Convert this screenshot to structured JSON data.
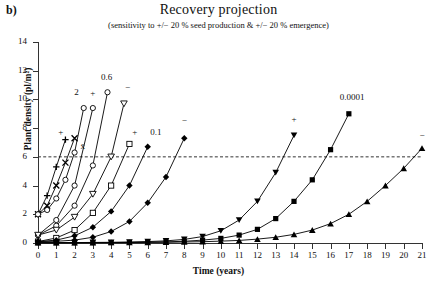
{
  "panel": {
    "label": "b)"
  },
  "title": "Recovery projection",
  "subtitle": "(sensitivity to +/− 20 % seed production & +/− 20 % emergence)",
  "axes": {
    "xlabel": "Time (years)",
    "ylabel": "Plant density (pl/m²)",
    "xticks": [
      "0",
      "1",
      "2",
      "3",
      "4",
      "5",
      "6",
      "7",
      "8",
      "9",
      "10",
      "11",
      "12",
      "13",
      "14",
      "15",
      "16",
      "17",
      "18",
      "19",
      "20",
      "21"
    ],
    "yticks": [
      "0",
      "2",
      "4",
      "6",
      "8",
      "10",
      "12",
      "14"
    ]
  },
  "annotations": {
    "group_2": "2",
    "group_06": "0.6",
    "group_01": "0.1",
    "group_00001": "0.0001",
    "plus": "+",
    "minus": "−",
    "mean": "x̄"
  },
  "chart_data": {
    "type": "line",
    "title": "Recovery projection",
    "subtitle": "(sensitivity to +/− 20 % seed production & +/− 20 % emergence)",
    "xlabel": "Time (years)",
    "ylabel": "Plant density (pl/m²)",
    "xlim": [
      0,
      21
    ],
    "ylim": [
      0,
      14
    ],
    "grid": false,
    "legend": "none",
    "threshold_line": {
      "y": 6,
      "style": "dashed",
      "color": "#333333"
    },
    "series": [
      {
        "name": "2 +",
        "group_label": "2",
        "sensitivity": "+",
        "marker": "plus-cross",
        "annotation": "+",
        "annotation_at": [
          1.25,
          7.6
        ],
        "x": [
          0,
          0.5,
          1,
          1.5
        ],
        "y": [
          2.0,
          3.3,
          5.3,
          7.2
        ]
      },
      {
        "name": "2 mean",
        "group_label": "2",
        "sensitivity": "mean",
        "marker": "x-cross",
        "annotation": "x̄",
        "annotation_at": [
          2.45,
          6.6
        ],
        "x": [
          0,
          0.5,
          1,
          1.5,
          2
        ],
        "y": [
          2.0,
          2.6,
          4.0,
          5.6,
          7.3
        ]
      },
      {
        "name": "2 −",
        "group_label": "2",
        "sensitivity": "−",
        "marker": "open-circle",
        "annotation": "2",
        "annotation_at": [
          2.1,
          10.4
        ],
        "x": [
          0,
          0.5,
          1,
          1.5,
          2,
          2.5
        ],
        "y": [
          2.0,
          2.3,
          3.1,
          4.4,
          6.3,
          9.4
        ]
      },
      {
        "name": "0.6 +",
        "group_label": "0.6",
        "sensitivity": "+",
        "marker": "open-circle",
        "annotation": "+",
        "annotation_at": [
          3.0,
          10.3
        ],
        "x": [
          0,
          1,
          2,
          3
        ],
        "y": [
          0.55,
          1.6,
          4.0,
          9.4
        ]
      },
      {
        "name": "0.6 mean",
        "group_label": "0.6",
        "sensitivity": "mean",
        "marker": "open-circle",
        "annotation": "0.6",
        "annotation_at": [
          3.75,
          11.4
        ],
        "x": [
          0,
          1,
          2,
          3,
          3.8
        ],
        "y": [
          0.55,
          1.2,
          2.6,
          5.4,
          10.5
        ]
      },
      {
        "name": "0.6 −",
        "group_label": "0.6",
        "sensitivity": "−",
        "marker": "open-triangle-down",
        "annotation": "−",
        "annotation_at": [
          4.9,
          10.7
        ],
        "x": [
          0,
          1,
          2,
          3,
          4,
          4.7
        ],
        "y": [
          0.55,
          0.9,
          1.8,
          3.4,
          6.0,
          9.7
        ]
      },
      {
        "name": "0.1 +",
        "group_label": "0.1",
        "sensitivity": "+",
        "marker": "open-square",
        "annotation": "+",
        "annotation_at": [
          5.3,
          7.6
        ],
        "x": [
          0,
          1,
          2,
          3,
          4,
          5
        ],
        "y": [
          0.1,
          0.35,
          0.9,
          2.1,
          4.0,
          6.9
        ]
      },
      {
        "name": "0.1 mean",
        "group_label": "0.1",
        "sensitivity": "mean",
        "marker": "filled-diamond",
        "annotation": "0.1",
        "annotation_at": [
          6.45,
          7.6
        ],
        "x": [
          0,
          1,
          2,
          3,
          4,
          5,
          6
        ],
        "y": [
          0.1,
          0.2,
          0.5,
          1.1,
          2.2,
          4.0,
          6.7
        ]
      },
      {
        "name": "0.1 −",
        "group_label": "0.1",
        "sensitivity": "−",
        "marker": "filled-diamond",
        "annotation": "−",
        "annotation_at": [
          8.0,
          8.4
        ],
        "x": [
          0,
          1,
          2,
          3,
          4,
          5,
          6,
          7,
          8
        ],
        "y": [
          0.1,
          0.12,
          0.2,
          0.4,
          0.8,
          1.5,
          2.8,
          4.6,
          7.3
        ]
      },
      {
        "name": "0.0001 +",
        "group_label": "0.0001",
        "sensitivity": "+",
        "marker": "filled-triangle-down",
        "annotation": "+",
        "annotation_at": [
          14.0,
          8.5
        ],
        "x": [
          0,
          1,
          2,
          3,
          4,
          5,
          6,
          7,
          8,
          9,
          10,
          11,
          12,
          13,
          14
        ],
        "y": [
          0.02,
          0.02,
          0.03,
          0.04,
          0.05,
          0.07,
          0.1,
          0.15,
          0.25,
          0.45,
          0.85,
          1.6,
          2.9,
          4.9,
          7.5
        ]
      },
      {
        "name": "0.0001 mean",
        "group_label": "0.0001",
        "sensitivity": "mean",
        "marker": "filled-square",
        "annotation": "0.0001",
        "annotation_at": [
          17.0,
          10.0
        ],
        "x": [
          0,
          1,
          2,
          3,
          4,
          5,
          6,
          7,
          8,
          9,
          10,
          11,
          12,
          13,
          14,
          15,
          16,
          17
        ],
        "y": [
          0.02,
          0.02,
          0.02,
          0.03,
          0.03,
          0.04,
          0.06,
          0.08,
          0.12,
          0.2,
          0.32,
          0.55,
          0.95,
          1.7,
          2.9,
          4.4,
          6.5,
          9.0
        ]
      },
      {
        "name": "0.0001 −",
        "group_label": "0.0001",
        "sensitivity": "−",
        "marker": "filled-triangle-up",
        "annotation": "−",
        "annotation_at": [
          21.0,
          7.4
        ],
        "x": [
          0,
          1,
          2,
          3,
          4,
          5,
          6,
          7,
          8,
          9,
          10,
          11,
          12,
          13,
          14,
          15,
          16,
          17,
          18,
          19,
          20,
          21
        ],
        "y": [
          0.02,
          0.02,
          0.02,
          0.02,
          0.03,
          0.03,
          0.04,
          0.05,
          0.07,
          0.09,
          0.13,
          0.18,
          0.27,
          0.4,
          0.6,
          0.9,
          1.35,
          2.0,
          2.9,
          4.0,
          5.2,
          6.6
        ]
      }
    ]
  }
}
